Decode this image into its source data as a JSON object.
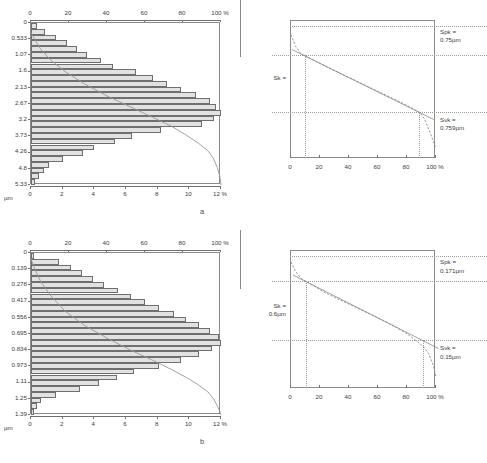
{
  "figure": {
    "panel_a_label": "a",
    "panel_b_label": "b"
  },
  "chart_data": [
    {
      "id": "hist-a",
      "type": "bar",
      "orientation": "horizontal",
      "title": "",
      "xlabel": "%",
      "ylabel": "µm",
      "unit_label": "µm",
      "top_axis_label": "100 %",
      "bottom_axis_label": "12 %",
      "top_ticks": [
        0,
        20,
        40,
        60,
        80,
        100
      ],
      "top_tick_labels": [
        "0",
        "20",
        "40",
        "60",
        "80",
        "100 %"
      ],
      "bottom_ticks": [
        0,
        2,
        4,
        6,
        8,
        10,
        12
      ],
      "bottom_tick_labels": [
        "0",
        "2",
        "4",
        "6",
        "8",
        "10",
        "12 %"
      ],
      "xlim": [
        0,
        12
      ],
      "ylim": [
        0,
        5.33
      ],
      "categories": [
        "0",
        "0.533",
        "1.07",
        "1.6",
        "2.13",
        "2.67",
        "3.2",
        "3.73",
        "4.26",
        "4.8",
        "5.33"
      ],
      "ytick_labels": [
        "0",
        "0.533",
        "1.07",
        "1.6",
        "2.13",
        "2.67",
        "3.2",
        "3.73",
        "4.26",
        "4.8",
        "5.33"
      ],
      "values": [
        0.35,
        0.9,
        1.55,
        2.25,
        2.9,
        3.55,
        4.4,
        5.2,
        6.6,
        7.7,
        8.6,
        9.5,
        10.4,
        11.3,
        11.7,
        12.0,
        11.55,
        10.8,
        8.2,
        6.4,
        5.3,
        4.0,
        3.3,
        2.0,
        1.15,
        0.85,
        0.5,
        0.28
      ],
      "grid": false,
      "legend": "none",
      "cumulative_curve": {
        "name": "cumulative bearing ratio",
        "x_pct": [
          0,
          2,
          5,
          10,
          18,
          28,
          40,
          52,
          64,
          74,
          82,
          88,
          93,
          96,
          98,
          99.4,
          100
        ],
        "y_um": [
          0.3,
          0.55,
          0.85,
          1.2,
          1.6,
          2.0,
          2.4,
          2.75,
          3.1,
          3.4,
          3.7,
          3.95,
          4.2,
          4.45,
          4.75,
          5.05,
          5.33
        ]
      }
    },
    {
      "id": "hist-b",
      "type": "bar",
      "orientation": "horizontal",
      "title": "",
      "xlabel": "%",
      "ylabel": "µm",
      "unit_label": "µm",
      "top_axis_label": "100 %",
      "bottom_axis_label": "12 %",
      "top_ticks": [
        0,
        20,
        40,
        60,
        80,
        100
      ],
      "top_tick_labels": [
        "0",
        "20",
        "40",
        "60",
        "80",
        "100 %"
      ],
      "bottom_ticks": [
        0,
        2,
        4,
        6,
        8,
        10,
        12
      ],
      "bottom_tick_labels": [
        "0",
        "2",
        "4",
        "6",
        "8",
        "10",
        "12 %"
      ],
      "xlim": [
        0,
        12
      ],
      "ylim": [
        0,
        1.39
      ],
      "categories": [
        "0",
        "0.139",
        "0.278",
        "0.417",
        "0.556",
        "0.695",
        "0.834",
        "0.973",
        "1.11",
        "1.25",
        "1.39"
      ],
      "ytick_labels": [
        "0",
        "0.139",
        "0.278",
        "0.417",
        "0.556",
        "0.695",
        "0.834",
        "0.973",
        "1.11",
        "1.25",
        "1.39"
      ],
      "values": [
        0.2,
        1.75,
        2.55,
        3.2,
        3.9,
        4.6,
        5.5,
        6.3,
        7.2,
        8.1,
        9.0,
        9.8,
        10.6,
        11.3,
        11.9,
        12.0,
        11.4,
        10.6,
        9.5,
        8.1,
        6.5,
        5.4,
        4.3,
        3.1,
        1.55,
        0.6,
        0.35,
        0.2
      ],
      "grid": false,
      "legend": "none",
      "cumulative_curve": {
        "name": "cumulative bearing ratio",
        "x_pct": [
          0,
          2,
          5,
          10,
          18,
          28,
          40,
          52,
          64,
          74,
          82,
          88,
          93,
          96,
          98,
          99.4,
          100
        ],
        "y_um": [
          0.05,
          0.14,
          0.24,
          0.36,
          0.5,
          0.62,
          0.73,
          0.83,
          0.92,
          1.0,
          1.07,
          1.13,
          1.19,
          1.25,
          1.31,
          1.36,
          1.39
        ]
      }
    },
    {
      "id": "abbott-a",
      "type": "line",
      "title": "",
      "xlabel": "%",
      "ylabel": "",
      "xlim": [
        0,
        100
      ],
      "xticks": [
        0,
        20,
        40,
        60,
        80,
        100
      ],
      "xtick_labels": [
        "0",
        "20",
        "40",
        "60",
        "80",
        "100 %"
      ],
      "annotations": {
        "spk_label": "Spk =",
        "spk_value": "0.75µm",
        "svk_label": "Svk =",
        "svk_value": "0.759µm",
        "sk_label": "Sk =",
        "sk_value": ""
      },
      "curve": {
        "name": "Abbott-Firestone bearing ratio curve",
        "x": [
          0,
          3,
          7,
          10,
          15,
          25,
          35,
          45,
          55,
          65,
          75,
          85,
          89,
          92,
          96,
          100
        ],
        "y": [
          0.9,
          0.82,
          0.76,
          0.745,
          0.72,
          0.665,
          0.615,
          0.565,
          0.515,
          0.465,
          0.415,
          0.36,
          0.335,
          0.29,
          0.19,
          0.075
        ]
      },
      "reference_lines": {
        "spk_level_y": 0.96,
        "sk_upper_y": 0.745,
        "sk_lower_y": 0.335,
        "mr1_x": 10,
        "mr2_x": 89
      }
    },
    {
      "id": "abbott-b",
      "type": "line",
      "title": "",
      "xlabel": "%",
      "ylabel": "",
      "xlim": [
        0,
        100
      ],
      "xticks": [
        0,
        20,
        40,
        60,
        80,
        100
      ],
      "xtick_labels": [
        "0",
        "20",
        "40",
        "60",
        "80",
        "100 %"
      ],
      "annotations": {
        "spk_label": "Spk =",
        "spk_value": "0.171µm",
        "svk_label": "Svk =",
        "svk_value": "0.15µm",
        "sk_label": "Sk =",
        "sk_value": "0.6µm"
      },
      "curve": {
        "name": "Abbott-Firestone bearing ratio curve",
        "x": [
          0,
          3,
          7,
          11,
          16,
          24,
          32,
          42,
          52,
          62,
          72,
          80,
          87,
          92,
          95,
          98,
          100
        ],
        "y": [
          0.92,
          0.855,
          0.8,
          0.775,
          0.745,
          0.695,
          0.655,
          0.605,
          0.555,
          0.505,
          0.45,
          0.4,
          0.345,
          0.3,
          0.255,
          0.175,
          0.09
        ]
      },
      "reference_lines": {
        "spk_level_y": 0.955,
        "sk_upper_y": 0.775,
        "sk_lower_y": 0.345,
        "mr1_x": 11,
        "mr2_x": 92
      }
    }
  ]
}
